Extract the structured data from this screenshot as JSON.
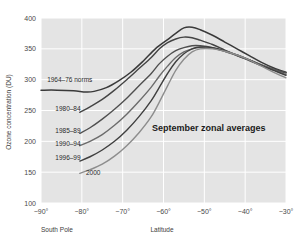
{
  "chart_data": {
    "type": "line",
    "title": "",
    "annotation": "September zonal averages",
    "xlabel": "Latitude",
    "ylabel": "Ozone concentration (DU)",
    "x_origin_label": "South Pole",
    "xlim": [
      -90,
      -30
    ],
    "ylim": [
      100,
      400
    ],
    "xticks": [
      -90,
      -80,
      -70,
      -60,
      -50,
      -40,
      -30
    ],
    "xtick_labels": [
      "−90°",
      "−80°",
      "−70°",
      "−60°",
      "−50°",
      "−40°",
      "−30°"
    ],
    "yticks": [
      100,
      150,
      200,
      250,
      300,
      350,
      400
    ],
    "ytick_labels": [
      "100",
      "150",
      "200",
      "250",
      "300",
      "350",
      "400"
    ],
    "grid": true,
    "grid_color": "#ffffff",
    "plot_bg": "#e4e4e4",
    "legend_position": "inline-left",
    "series": [
      {
        "name": "1964–76 norms",
        "color": "#3a3a3a",
        "width": 1.5,
        "label_x": -88.5,
        "label_y": 296,
        "points": [
          [
            -90,
            283
          ],
          [
            -86,
            283
          ],
          [
            -82,
            282
          ],
          [
            -79,
            280
          ],
          [
            -77,
            281
          ],
          [
            -74,
            287
          ],
          [
            -71,
            298
          ],
          [
            -68,
            312
          ],
          [
            -65,
            330
          ],
          [
            -62,
            350
          ],
          [
            -59,
            365
          ],
          [
            -57,
            375
          ],
          [
            -55,
            384
          ],
          [
            -53,
            385
          ],
          [
            -51,
            381
          ],
          [
            -48,
            372
          ],
          [
            -45,
            361
          ],
          [
            -42,
            350
          ],
          [
            -39,
            339
          ],
          [
            -36,
            328
          ],
          [
            -33,
            319
          ],
          [
            -30,
            312
          ]
        ]
      },
      {
        "name": "1980–84",
        "color": "#444444",
        "width": 1.4,
        "label_x": -86.5,
        "label_y": 249,
        "points": [
          [
            -80.5,
            247
          ],
          [
            -78,
            256
          ],
          [
            -75,
            268
          ],
          [
            -72,
            283
          ],
          [
            -69,
            300
          ],
          [
            -66,
            318
          ],
          [
            -63,
            336
          ],
          [
            -61,
            350
          ],
          [
            -59,
            360
          ],
          [
            -57,
            366
          ],
          [
            -55,
            369
          ],
          [
            -53,
            368
          ],
          [
            -51,
            364
          ],
          [
            -48,
            357
          ],
          [
            -45,
            348
          ],
          [
            -42,
            339
          ],
          [
            -39,
            331
          ],
          [
            -36,
            323
          ],
          [
            -33,
            316
          ],
          [
            -30,
            311
          ]
        ]
      },
      {
        "name": "1985–89",
        "color": "#4f4f4f",
        "width": 1.4,
        "label_x": -86.5,
        "label_y": 214,
        "points": [
          [
            -80.5,
            213
          ],
          [
            -78,
            222
          ],
          [
            -75,
            236
          ],
          [
            -72,
            252
          ],
          [
            -69,
            270
          ],
          [
            -66,
            290
          ],
          [
            -63,
            310
          ],
          [
            -61,
            326
          ],
          [
            -59,
            338
          ],
          [
            -57,
            347
          ],
          [
            -55,
            352
          ],
          [
            -53,
            355
          ],
          [
            -51,
            355
          ],
          [
            -48,
            352
          ],
          [
            -45,
            346
          ],
          [
            -42,
            339
          ],
          [
            -39,
            332
          ],
          [
            -36,
            324
          ],
          [
            -33,
            317
          ],
          [
            -30,
            311
          ]
        ]
      },
      {
        "name": "1990–94",
        "color": "#6b6b6b",
        "width": 1.4,
        "label_x": -86.5,
        "label_y": 192,
        "points": [
          [
            -80.5,
            193
          ],
          [
            -78,
            200
          ],
          [
            -75,
            211
          ],
          [
            -72,
            226
          ],
          [
            -69,
            244
          ],
          [
            -66,
            265
          ],
          [
            -63,
            288
          ],
          [
            -61,
            306
          ],
          [
            -59,
            322
          ],
          [
            -57,
            336
          ],
          [
            -55,
            345
          ],
          [
            -53,
            350
          ],
          [
            -51,
            352
          ],
          [
            -48,
            351
          ],
          [
            -45,
            346
          ],
          [
            -42,
            340
          ],
          [
            -39,
            332
          ],
          [
            -36,
            324
          ],
          [
            -33,
            316
          ],
          [
            -30,
            308
          ]
        ]
      },
      {
        "name": "1996–99",
        "color": "#3f3f3f",
        "width": 1.4,
        "label_x": -86.5,
        "label_y": 170,
        "points": [
          [
            -80.5,
            168
          ],
          [
            -78,
            175
          ],
          [
            -75,
            186
          ],
          [
            -72,
            200
          ],
          [
            -69,
            218
          ],
          [
            -66,
            240
          ],
          [
            -63,
            266
          ],
          [
            -61,
            288
          ],
          [
            -59,
            310
          ],
          [
            -57,
            329
          ],
          [
            -55,
            342
          ],
          [
            -53,
            350
          ],
          [
            -51,
            353
          ],
          [
            -48,
            352
          ],
          [
            -45,
            347
          ],
          [
            -42,
            340
          ],
          [
            -39,
            332
          ],
          [
            -36,
            323
          ],
          [
            -33,
            315
          ],
          [
            -30,
            307
          ]
        ]
      },
      {
        "name": "2000",
        "color": "#8d8d8d",
        "width": 1.4,
        "label_x": -79.0,
        "label_y": 146,
        "points": [
          [
            -80.5,
            148
          ],
          [
            -78,
            154
          ],
          [
            -75,
            163
          ],
          [
            -72,
            176
          ],
          [
            -69,
            193
          ],
          [
            -66,
            214
          ],
          [
            -63,
            240
          ],
          [
            -61,
            264
          ],
          [
            -59,
            290
          ],
          [
            -57,
            315
          ],
          [
            -55,
            333
          ],
          [
            -53,
            345
          ],
          [
            -51,
            350
          ],
          [
            -48,
            350
          ],
          [
            -45,
            346
          ],
          [
            -42,
            340
          ],
          [
            -39,
            332
          ],
          [
            -36,
            322
          ],
          [
            -33,
            312
          ],
          [
            -30,
            303
          ]
        ]
      }
    ]
  }
}
